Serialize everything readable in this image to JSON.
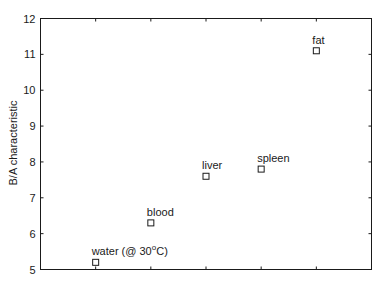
{
  "chart_data": {
    "type": "scatter",
    "title": "",
    "xlabel": "",
    "ylabel": "B/A characteristic",
    "ylim": [
      5,
      12
    ],
    "yticks": [
      5,
      6,
      7,
      8,
      9,
      10,
      11,
      12
    ],
    "xticks_count": 5,
    "grid": false,
    "marker": "square",
    "points": [
      {
        "label": "water (@ 30°C)",
        "label_main": "water (@ 30",
        "label_sup": "o",
        "label_end": "C)",
        "x": 1,
        "y": 5.2
      },
      {
        "label": "blood",
        "x": 2,
        "y": 6.3
      },
      {
        "label": "liver",
        "x": 3,
        "y": 7.6
      },
      {
        "label": "spleen",
        "x": 4,
        "y": 7.8
      },
      {
        "label": "fat",
        "x": 5,
        "y": 11.1
      }
    ],
    "xlim": [
      0,
      6
    ]
  }
}
